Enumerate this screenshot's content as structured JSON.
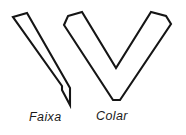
{
  "figure": {
    "background_color": "#ffffff",
    "stroke_color": "#151515",
    "fill_color": "#ffffff",
    "shapes": [
      {
        "name": "faixa",
        "label": "Faixa",
        "description": "sash band drawn as a long narrow diagonal strip running from upper left down to a pointed tip at lower right",
        "outline_points": "13,17 27,13 70,88 70,105 62,90 62,86"
      },
      {
        "name": "colar",
        "label": "Colar",
        "description": "collar drawn as a V shaped band with two squared ends at the top and a chevron point at the bottom",
        "outline_points": "68,16 82,12 116,68 151,12 166,16 171,24 120,100 113,100 64,25"
      }
    ]
  },
  "captions": {
    "faixa": "Faixa",
    "colar": "Colar"
  }
}
